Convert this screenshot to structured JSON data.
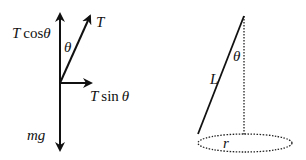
{
  "diagram": {
    "colors": {
      "line": "#111111",
      "background": "#ffffff"
    },
    "free_body": {
      "labels": {
        "t_cos": {
          "italic_T": "T",
          "func": "cos",
          "theta": "θ"
        },
        "tension": "T",
        "theta": "θ",
        "t_sin": {
          "italic_T": "T",
          "func": "sin",
          "theta": "θ"
        },
        "weight": "mg"
      }
    },
    "cone": {
      "labels": {
        "length": "L",
        "angle": "θ",
        "radius": "r"
      }
    }
  }
}
